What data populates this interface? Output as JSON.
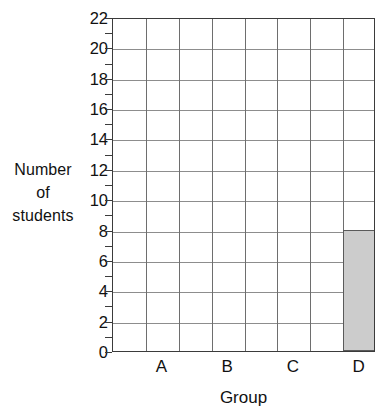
{
  "chart_data": {
    "type": "bar",
    "title": "",
    "xlabel": "Group",
    "ylabel": "Number of students",
    "categories": [
      "A",
      "B",
      "C",
      "D"
    ],
    "values": [
      0,
      0,
      0,
      8
    ],
    "ylim": [
      0,
      22
    ],
    "y_tick_step": 2,
    "y_minor_tick_step": 1,
    "y_tick_labels": [
      "0",
      "2",
      "4",
      "6",
      "8",
      "10",
      "12",
      "14",
      "16",
      "18",
      "20",
      "22"
    ],
    "y_minor_tick_values": [
      1,
      3,
      5,
      7,
      9,
      11,
      13,
      15,
      17,
      19,
      21
    ],
    "grid": true,
    "grid_columns": 8,
    "legend": "none",
    "bar_fill_color": "#cccccc",
    "bar_border_color": "#5a5a5a",
    "axis_color": "#3b3b3b",
    "grid_color": "#8d8d8d"
  },
  "axis_titles": {
    "y_line1": "Number",
    "y_line2": "of",
    "y_line3": "students",
    "x": "Group"
  }
}
